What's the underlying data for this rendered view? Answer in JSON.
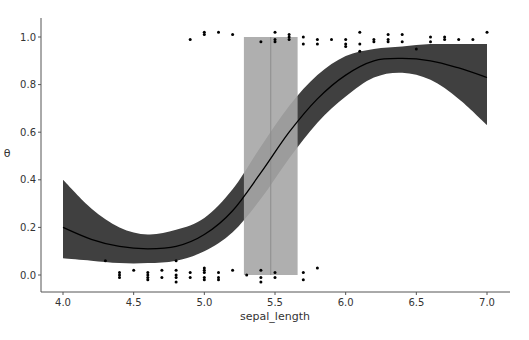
{
  "chart_data": {
    "type": "line",
    "title": "",
    "xlabel": "sepal_length",
    "ylabel": "θ",
    "xlim": [
      3.85,
      7.05
    ],
    "ylim": [
      -0.07,
      1.07
    ],
    "grid": false,
    "legend": null,
    "x_ticks": [
      "4.0",
      "4.5",
      "5.0",
      "5.5",
      "6.0",
      "6.5",
      "7.0"
    ],
    "y_ticks": [
      "0.0",
      "0.2",
      "0.4",
      "0.6",
      "0.8",
      "1.0"
    ],
    "series": [
      {
        "name": "theta_mean",
        "kind": "line",
        "color": "#000000",
        "x": [
          4.0,
          4.2,
          4.4,
          4.6,
          4.8,
          5.0,
          5.2,
          5.4,
          5.6,
          5.8,
          6.0,
          6.2,
          6.4,
          6.6,
          6.8,
          7.0
        ],
        "y": [
          0.2,
          0.15,
          0.12,
          0.11,
          0.12,
          0.17,
          0.27,
          0.43,
          0.6,
          0.74,
          0.84,
          0.9,
          0.91,
          0.9,
          0.87,
          0.83
        ]
      },
      {
        "name": "theta_hdi",
        "kind": "band",
        "color": "#404040",
        "x": [
          4.0,
          4.2,
          4.4,
          4.6,
          4.8,
          5.0,
          5.2,
          5.4,
          5.6,
          5.8,
          6.0,
          6.2,
          6.4,
          6.6,
          6.8,
          7.0
        ],
        "lower": [
          0.07,
          0.06,
          0.05,
          0.05,
          0.06,
          0.1,
          0.18,
          0.32,
          0.49,
          0.64,
          0.75,
          0.83,
          0.85,
          0.82,
          0.74,
          0.63
        ],
        "upper": [
          0.4,
          0.28,
          0.2,
          0.17,
          0.19,
          0.24,
          0.36,
          0.54,
          0.71,
          0.84,
          0.92,
          0.95,
          0.96,
          0.97,
          0.97,
          0.97
        ]
      },
      {
        "name": "decision_boundary_hdi",
        "kind": "vspan",
        "color": "#a6a6a6",
        "x_range": [
          5.28,
          5.66
        ],
        "y_range": [
          0.0,
          1.0
        ]
      },
      {
        "name": "decision_boundary_mean",
        "kind": "vline",
        "color": "#8c8c8c",
        "x": 5.47
      },
      {
        "name": "observations_class0",
        "kind": "scatter",
        "color": "#000000",
        "points": [
          [
            4.3,
            0.06
          ],
          [
            4.4,
            0.01
          ],
          [
            4.4,
            -0.01
          ],
          [
            4.4,
            0.0
          ],
          [
            4.5,
            0.02
          ],
          [
            4.6,
            -0.02
          ],
          [
            4.6,
            0.0
          ],
          [
            4.6,
            0.01
          ],
          [
            4.6,
            -0.01
          ],
          [
            4.7,
            0.02
          ],
          [
            4.7,
            -0.01
          ],
          [
            4.8,
            0.06
          ],
          [
            4.8,
            0.02
          ],
          [
            4.8,
            -0.01
          ],
          [
            4.8,
            0.0
          ],
          [
            4.8,
            -0.03
          ],
          [
            4.9,
            0.01
          ],
          [
            4.9,
            -0.01
          ],
          [
            5.0,
            0.03
          ],
          [
            5.0,
            0.01
          ],
          [
            5.0,
            -0.01
          ],
          [
            5.0,
            -0.02
          ],
          [
            5.0,
            0.02
          ],
          [
            5.1,
            0.01
          ],
          [
            5.1,
            -0.01
          ],
          [
            5.1,
            -0.02
          ],
          [
            5.2,
            0.02
          ],
          [
            5.3,
            0.0
          ],
          [
            5.4,
            0.02
          ],
          [
            5.4,
            -0.01
          ],
          [
            5.4,
            -0.03
          ],
          [
            5.5,
            0.01
          ],
          [
            5.5,
            -0.01
          ],
          [
            5.7,
            0.01
          ],
          [
            5.7,
            -0.02
          ],
          [
            5.8,
            0.03
          ]
        ]
      },
      {
        "name": "observations_class1",
        "kind": "scatter",
        "color": "#000000",
        "points": [
          [
            4.9,
            0.99
          ],
          [
            5.0,
            1.01
          ],
          [
            5.0,
            1.02
          ],
          [
            5.1,
            1.02
          ],
          [
            5.2,
            1.01
          ],
          [
            5.4,
            0.98
          ],
          [
            5.5,
            1.02
          ],
          [
            5.5,
            0.99
          ],
          [
            5.5,
            0.98
          ],
          [
            5.6,
            1.01
          ],
          [
            5.6,
            1.0
          ],
          [
            5.6,
            0.99
          ],
          [
            5.7,
            1.0
          ],
          [
            5.7,
            0.97
          ],
          [
            5.8,
            0.99
          ],
          [
            5.8,
            0.97
          ],
          [
            5.9,
            0.99
          ],
          [
            6.0,
            0.99
          ],
          [
            6.0,
            0.96
          ],
          [
            6.0,
            0.97
          ],
          [
            6.1,
            1.02
          ],
          [
            6.1,
            0.97
          ],
          [
            6.1,
            0.94
          ],
          [
            6.2,
            0.99
          ],
          [
            6.2,
            0.98
          ],
          [
            6.3,
            1.01
          ],
          [
            6.3,
            0.99
          ],
          [
            6.3,
            0.98
          ],
          [
            6.4,
            1.01
          ],
          [
            6.4,
            0.98
          ],
          [
            6.5,
            0.95
          ],
          [
            6.6,
            1.0
          ],
          [
            6.6,
            0.98
          ],
          [
            6.7,
            1.0
          ],
          [
            6.7,
            0.99
          ],
          [
            6.8,
            0.99
          ],
          [
            6.9,
            0.99
          ],
          [
            7.0,
            1.02
          ]
        ]
      }
    ]
  }
}
